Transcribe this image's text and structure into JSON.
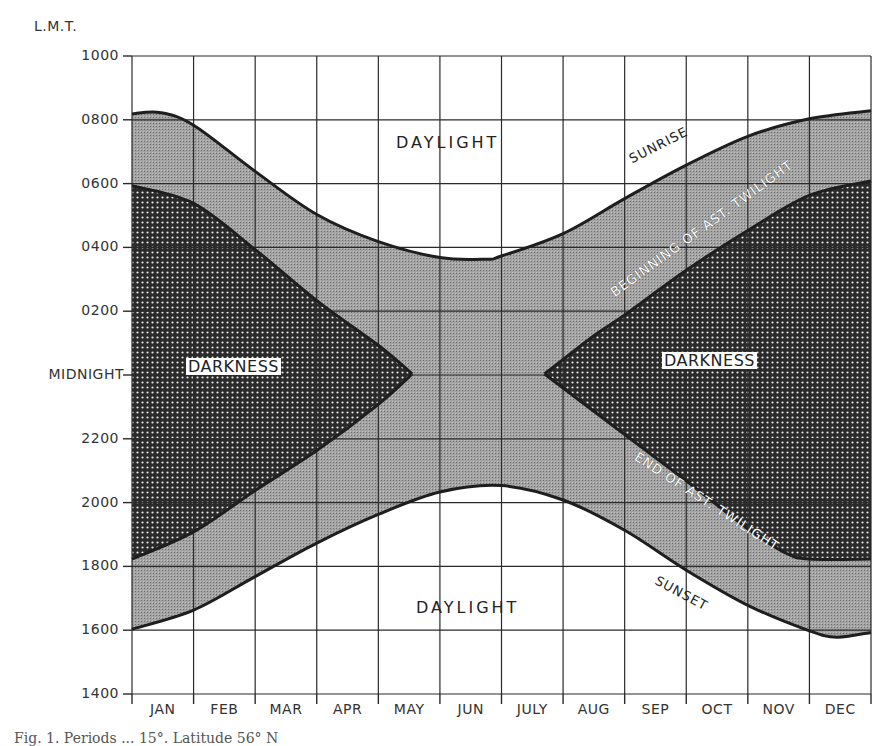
{
  "chart_data": {
    "type": "area",
    "title": "",
    "ylabel": "L.M.T.",
    "xlabel": "",
    "caption": "Fig. 1. Periods ... 15°. Latitude 56° N",
    "y_ticks": [
      "1000",
      "0800",
      "0600",
      "0400",
      "0200",
      "MIDNIGHT",
      "2200",
      "2000",
      "1800",
      "1600",
      "1400"
    ],
    "categories": [
      "JAN",
      "FEB",
      "MAR",
      "APR",
      "MAY",
      "JUN",
      "JULY",
      "AUG",
      "SEP",
      "OCT",
      "NOV",
      "DEC"
    ],
    "ylim": [
      "1400",
      "1000 (next day)"
    ],
    "grid": true,
    "units_note": "y values in hours relative to midnight; positive = morning (e.g. 8.25 = 0815), negative = evening (e.g. -4 = 2000)",
    "x_positions_note": "x expressed in months from 1 Jan (0 = start of JAN, 12 = end of DEC)",
    "series": [
      {
        "name": "SUNRISE",
        "points": [
          [
            0,
            8.15
          ],
          [
            0.45,
            8.2
          ],
          [
            1,
            7.8
          ],
          [
            2,
            6.35
          ],
          [
            3,
            5.0
          ],
          [
            4,
            4.15
          ],
          [
            5,
            3.65
          ],
          [
            5.75,
            3.6
          ],
          [
            6,
            3.7
          ],
          [
            7,
            4.4
          ],
          [
            8,
            5.5
          ],
          [
            9,
            6.55
          ],
          [
            10,
            7.45
          ],
          [
            11,
            8.0
          ],
          [
            12,
            8.25
          ]
        ]
      },
      {
        "name": "BEGINNING OF AST. TWILIGHT",
        "points": [
          [
            0,
            5.9
          ],
          [
            1,
            5.35
          ],
          [
            2,
            3.9
          ],
          [
            3,
            2.3
          ],
          [
            4,
            0.9
          ],
          [
            4.55,
            0.0
          ],
          [
            6.7,
            0.0
          ],
          [
            7.5,
            1.2
          ],
          [
            8,
            1.85
          ],
          [
            9,
            3.25
          ],
          [
            10,
            4.5
          ],
          [
            11,
            5.6
          ],
          [
            12,
            6.05
          ]
        ]
      },
      {
        "name": "END OF AST. TWILIGHT",
        "points": [
          [
            0,
            -5.8
          ],
          [
            1,
            -4.95
          ],
          [
            2,
            -3.65
          ],
          [
            3,
            -2.4
          ],
          [
            4,
            -0.95
          ],
          [
            4.55,
            0.0
          ],
          [
            6.7,
            0.0
          ],
          [
            8,
            -1.9
          ],
          [
            9,
            -3.35
          ],
          [
            10,
            -4.85
          ],
          [
            10.6,
            -5.6
          ],
          [
            11,
            -5.8
          ],
          [
            12,
            -5.8
          ]
        ]
      },
      {
        "name": "SUNSET",
        "points": [
          [
            0,
            -8.0
          ],
          [
            1,
            -7.4
          ],
          [
            2,
            -6.35
          ],
          [
            3,
            -5.3
          ],
          [
            4,
            -4.4
          ],
          [
            5,
            -3.7
          ],
          [
            6,
            -3.5
          ],
          [
            7,
            -3.95
          ],
          [
            8,
            -4.9
          ],
          [
            9,
            -6.15
          ],
          [
            10,
            -7.25
          ],
          [
            11,
            -8.05
          ],
          [
            11.45,
            -8.25
          ],
          [
            12,
            -8.1
          ]
        ]
      }
    ],
    "regions": [
      {
        "name": "DAYLIGHT",
        "position": "top",
        "fill": "#ffffff"
      },
      {
        "name": "Twilight",
        "position": "between sunrise/sunset and astronomical twilight",
        "fill": "#9a9a9a"
      },
      {
        "name": "DARKNESS",
        "position": "left (Jan–May)",
        "fill": "#2a2a2a"
      },
      {
        "name": "DARKNESS",
        "position": "right (July–Dec)",
        "fill": "#2a2a2a"
      },
      {
        "name": "DAYLIGHT",
        "position": "bottom",
        "fill": "#ffffff"
      }
    ]
  },
  "labels": {
    "unit": "L.M.T.",
    "daylight_top": "DAYLIGHT",
    "daylight_bottom": "DAYLIGHT",
    "darkness_left": "DARKNESS",
    "darkness_right": "DARKNESS",
    "sunrise": "SUNRISE",
    "sunset": "SUNSET",
    "begin_twilight": "BEGINNING OF AST. TWILIGHT",
    "end_twilight": "END OF AST. TWILIGHT"
  },
  "colors": {
    "twilight_fill": "#9a9a9a",
    "darkness_fill": "#2a2a2a",
    "darkness_dot": "#e8e8e8",
    "line": "#1e1e1e",
    "grid": "#2a2a2a"
  }
}
